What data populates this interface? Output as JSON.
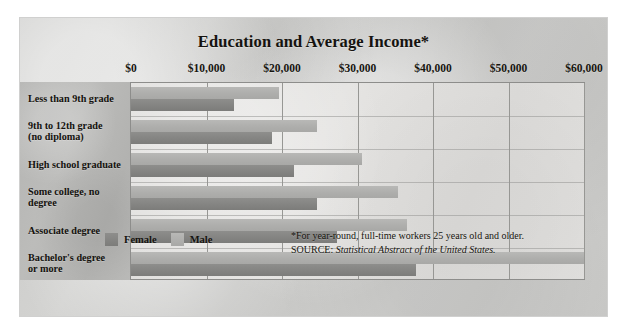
{
  "chart_data": {
    "type": "bar",
    "orientation": "horizontal",
    "title": "Education and Average Income*",
    "xlabel": "",
    "ylabel": "",
    "xlim": [
      0,
      60000
    ],
    "xticks": [
      0,
      10000,
      20000,
      30000,
      40000,
      50000,
      60000
    ],
    "xtick_labels": [
      "$0",
      "$10,000",
      "$20,000",
      "$30,000",
      "$40,000",
      "$50,000",
      "$60,000"
    ],
    "grid": true,
    "legend_position": "bottom-left",
    "categories": [
      "Less than 9th grade",
      "9th to 12th grade (no diploma)",
      "High school graduate",
      "Some college, no degree",
      "Associate degree",
      "Bachelor's degree or more"
    ],
    "series": [
      {
        "name": "Male",
        "color": "#b0b0ae",
        "values": [
          19600,
          24600,
          30600,
          35300,
          36600,
          60000
        ]
      },
      {
        "name": "Female",
        "color": "#848482",
        "values": [
          13700,
          18700,
          21600,
          24600,
          27300,
          37700
        ]
      }
    ],
    "annotations": [
      "*For year-round, full-time workers 25 years old and older.",
      "SOURCE: Statistical Abstract of the United States."
    ]
  },
  "chart": {
    "title": "Education and Average Income*",
    "axis": {
      "ticks": [
        {
          "label": "$0",
          "value": 0
        },
        {
          "label": "$10,000",
          "value": 10000
        },
        {
          "label": "$20,000",
          "value": 20000
        },
        {
          "label": "$30,000",
          "value": 30000
        },
        {
          "label": "$40,000",
          "value": 40000
        },
        {
          "label": "$50,000",
          "value": 50000
        },
        {
          "label": "$60,000",
          "value": 60000
        }
      ]
    },
    "rows": [
      {
        "label_line1": "Less than 9th grade",
        "label_line2": "",
        "male": 19600,
        "female": 13700
      },
      {
        "label_line1": "9th to 12th grade",
        "label_line2": "(no diploma)",
        "male": 24600,
        "female": 18700
      },
      {
        "label_line1": "High school graduate",
        "label_line2": "",
        "male": 30600,
        "female": 21600
      },
      {
        "label_line1": "Some college, no",
        "label_line2": "degree",
        "male": 35300,
        "female": 24600
      },
      {
        "label_line1": "Associate degree",
        "label_line2": "",
        "male": 36600,
        "female": 27300
      },
      {
        "label_line1": "Bachelor's degree",
        "label_line2": "or more",
        "male": 60000,
        "female": 37700
      }
    ],
    "legend": [
      {
        "name": "female-legend",
        "label": "Female"
      },
      {
        "name": "male-legend",
        "label": "Male"
      }
    ],
    "footnote": {
      "line1": "*For year-round, full-time workers 25 years old and older.",
      "source_prefix": "SOURCE: ",
      "source_title": "Statistical Abstract of the United States."
    },
    "colors": {
      "female": "#848482",
      "male": "#b0b0ae",
      "panel": "#cbcbc9",
      "label_column": "#b6b6b4",
      "plot": "#e0dfdd",
      "grid": "#979794",
      "text": "#14120e"
    }
  }
}
